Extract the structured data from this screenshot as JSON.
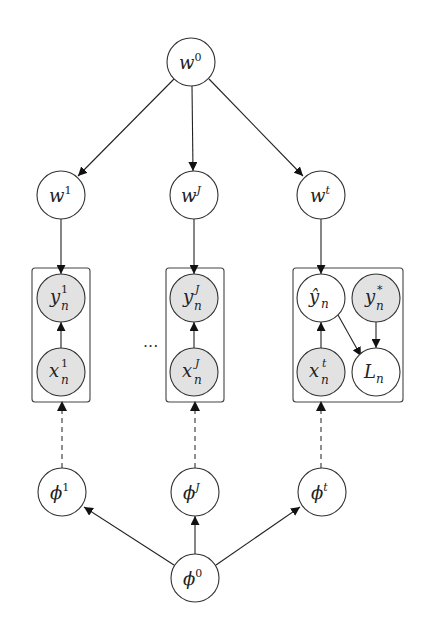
{
  "diagram": {
    "type": "probabilistic-graphical-model",
    "colors": {
      "observed_fill": "#e2e2e2",
      "latent_fill": "#ffffff",
      "stroke": "#333333"
    },
    "ellipsis": "...",
    "nodes": {
      "w0": {
        "base": "w",
        "sup": "0",
        "sub": "",
        "observed": false
      },
      "w1": {
        "base": "w",
        "sup": "1",
        "sub": "",
        "observed": false
      },
      "wJ": {
        "base": "w",
        "sup": "J",
        "sub": "",
        "observed": false
      },
      "wt": {
        "base": "w",
        "sup": "t",
        "sub": "",
        "observed": false
      },
      "y1n": {
        "base": "y",
        "sup": "1",
        "sub": "n",
        "observed": true
      },
      "x1n": {
        "base": "x",
        "sup": "1",
        "sub": "n",
        "observed": true
      },
      "yJn": {
        "base": "y",
        "sup": "J",
        "sub": "n",
        "observed": true
      },
      "xJn": {
        "base": "x",
        "sup": "J",
        "sub": "n",
        "observed": true
      },
      "yhatn": {
        "base": "ŷ",
        "sup": "",
        "sub": "n",
        "observed": false
      },
      "ystarn": {
        "base": "y",
        "sup": "*",
        "sub": "n",
        "observed": true
      },
      "xtn": {
        "base": "x",
        "sup": "t",
        "sub": "n",
        "observed": true
      },
      "Ln": {
        "base": "L",
        "sup": "",
        "sub": "n",
        "observed": false
      },
      "phi1": {
        "base": "ϕ",
        "sup": "1",
        "sub": "",
        "observed": false
      },
      "phiJ": {
        "base": "ϕ",
        "sup": "J",
        "sub": "",
        "observed": false
      },
      "phit": {
        "base": "ϕ",
        "sup": "t",
        "sub": "",
        "observed": false
      },
      "phi0": {
        "base": "ϕ",
        "sup": "0",
        "sub": "",
        "observed": false
      }
    },
    "edges": [
      {
        "from": "w0",
        "to": "w1",
        "style": "solid"
      },
      {
        "from": "w0",
        "to": "wJ",
        "style": "solid"
      },
      {
        "from": "w0",
        "to": "wt",
        "style": "solid"
      },
      {
        "from": "w1",
        "to": "y1n",
        "style": "solid"
      },
      {
        "from": "wJ",
        "to": "yJn",
        "style": "solid"
      },
      {
        "from": "wt",
        "to": "yhatn",
        "style": "solid"
      },
      {
        "from": "x1n",
        "to": "y1n",
        "style": "solid"
      },
      {
        "from": "xJn",
        "to": "yJn",
        "style": "solid"
      },
      {
        "from": "xtn",
        "to": "yhatn",
        "style": "solid"
      },
      {
        "from": "yhatn",
        "to": "Ln",
        "style": "solid"
      },
      {
        "from": "ystarn",
        "to": "Ln",
        "style": "solid"
      },
      {
        "from": "phi1",
        "to": "plate1",
        "style": "dashed"
      },
      {
        "from": "phiJ",
        "to": "plateJ",
        "style": "dashed"
      },
      {
        "from": "phit",
        "to": "platet",
        "style": "dashed"
      },
      {
        "from": "phi0",
        "to": "phi1",
        "style": "solid"
      },
      {
        "from": "phi0",
        "to": "phiJ",
        "style": "solid"
      },
      {
        "from": "phi0",
        "to": "phit",
        "style": "solid"
      }
    ]
  }
}
